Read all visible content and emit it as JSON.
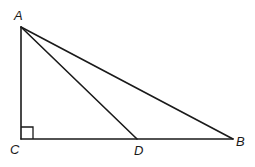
{
  "diagram": {
    "type": "right-triangle",
    "right_angle_at": "C",
    "points": {
      "A": {
        "label": "A",
        "x": 21,
        "y": 27,
        "label_x": 14,
        "label_y": 20
      },
      "C": {
        "label": "C",
        "x": 21,
        "y": 139,
        "label_x": 10,
        "label_y": 154
      },
      "D": {
        "label": "D",
        "x": 137,
        "y": 139,
        "label_x": 134,
        "label_y": 155
      },
      "B": {
        "label": "B",
        "x": 233,
        "y": 139,
        "label_x": 236,
        "label_y": 146
      }
    },
    "segments": [
      {
        "name": "AC",
        "from": "A",
        "to": "C"
      },
      {
        "name": "CB",
        "from": "C",
        "to": "B"
      },
      {
        "name": "AB",
        "from": "A",
        "to": "B"
      },
      {
        "name": "AD",
        "from": "A",
        "to": "D"
      }
    ],
    "right_angle_marker_size": 12,
    "colors": {
      "stroke": "#1a1a1a",
      "background": "#ffffff"
    }
  }
}
